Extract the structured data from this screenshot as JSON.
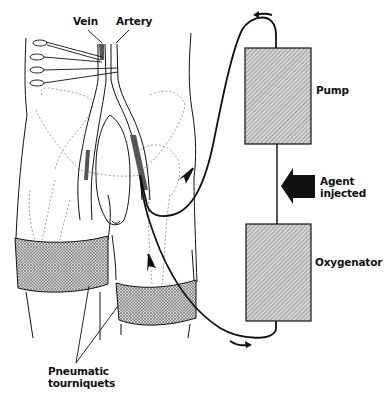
{
  "figure": {
    "type": "medical-schematic"
  },
  "labels": {
    "vein": "Vein",
    "artery": "Artery",
    "pump": "Pump",
    "agent_line1": "Agent",
    "agent_line2": "injected",
    "oxygenator": "Oxygenator",
    "tourniquets_line1": "Pneumatic",
    "tourniquets_line2": "tourniquets"
  },
  "components": [
    {
      "name": "Pump",
      "shape": "hatched-rectangle"
    },
    {
      "name": "Oxygenator",
      "shape": "hatched-rectangle"
    },
    {
      "name": "Agent injected",
      "shape": "solid-left-arrow"
    },
    {
      "name": "Pneumatic tourniquets",
      "count": 2,
      "shape": "stippled-band"
    }
  ],
  "flow": [
    "Oxygenator",
    "limb (arterial inflow)",
    "limb (venous outflow)",
    "Pump",
    "Agent injected",
    "Oxygenator"
  ],
  "colors": {
    "line": "#111111",
    "box_fill": "#bdbdbd",
    "band_fill": "#a8a8a8",
    "background": "#ffffff"
  }
}
